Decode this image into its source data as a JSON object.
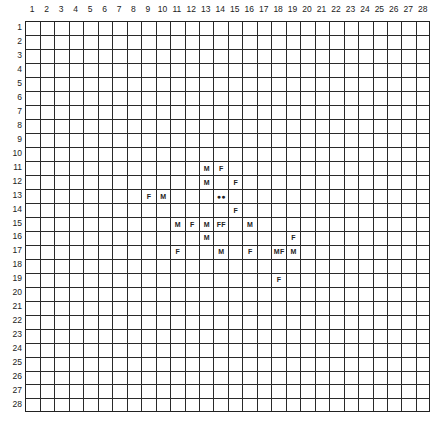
{
  "grid": {
    "columns": 28,
    "rows": 28,
    "column_labels": [
      "1",
      "2",
      "3",
      "4",
      "5",
      "6",
      "7",
      "8",
      "9",
      "10",
      "11",
      "12",
      "13",
      "14",
      "15",
      "16",
      "17",
      "18",
      "19",
      "20",
      "21",
      "22",
      "23",
      "24",
      "25",
      "26",
      "27",
      "28"
    ],
    "row_labels": [
      "1",
      "2",
      "3",
      "4",
      "5",
      "6",
      "7",
      "8",
      "9",
      "10",
      "11",
      "12",
      "13",
      "14",
      "15",
      "16",
      "17",
      "18",
      "19",
      "20",
      "21",
      "22",
      "23",
      "24",
      "25",
      "26",
      "27",
      "28"
    ],
    "line_color": "#2a2a2a",
    "background": "#ffffff"
  },
  "marks": [
    {
      "col": 13,
      "row": 11,
      "text": "M"
    },
    {
      "col": 14,
      "row": 11,
      "text": "F"
    },
    {
      "col": 13,
      "row": 12,
      "text": "M"
    },
    {
      "col": 15,
      "row": 12,
      "text": "F"
    },
    {
      "col": 9,
      "row": 13,
      "text": "F"
    },
    {
      "col": 10,
      "row": 13,
      "text": "M"
    },
    {
      "col": 14,
      "row": 13,
      "text": "●●"
    },
    {
      "col": 15,
      "row": 14,
      "text": "F"
    },
    {
      "col": 11,
      "row": 15,
      "text": "M"
    },
    {
      "col": 12,
      "row": 15,
      "text": "F"
    },
    {
      "col": 13,
      "row": 15,
      "text": "M"
    },
    {
      "col": 14,
      "row": 15,
      "text": "FF"
    },
    {
      "col": 16,
      "row": 15,
      "text": "M"
    },
    {
      "col": 13,
      "row": 16,
      "text": "M"
    },
    {
      "col": 19,
      "row": 16,
      "text": "F"
    },
    {
      "col": 11,
      "row": 17,
      "text": "F"
    },
    {
      "col": 14,
      "row": 17,
      "text": "M"
    },
    {
      "col": 16,
      "row": 17,
      "text": "F"
    },
    {
      "col": 18,
      "row": 17,
      "text": "MF"
    },
    {
      "col": 19,
      "row": 17,
      "text": "M"
    },
    {
      "col": 18,
      "row": 19,
      "text": "F"
    }
  ]
}
